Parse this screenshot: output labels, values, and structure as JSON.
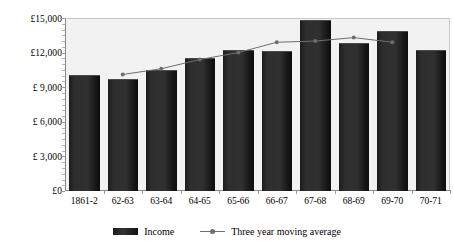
{
  "chart_data": {
    "type": "bar",
    "title": "",
    "xlabel": "",
    "ylabel": "",
    "categories": [
      "1861-2",
      "62-63",
      "63-64",
      "64-65",
      "65-66",
      "66-67",
      "67-68",
      "68-69",
      "69-70",
      "70-71"
    ],
    "ylim": [
      0,
      15000
    ],
    "ytick_values": [
      0,
      3000,
      6000,
      9000,
      12000,
      15000
    ],
    "ytick_labels": [
      "£0",
      "£ 3,000",
      "£ 6,000",
      "£ 9,000",
      "£12,000",
      "£15,000"
    ],
    "grid": false,
    "legend_position": "bottom",
    "series": [
      {
        "name": "Income",
        "type": "bar",
        "color": "#262626",
        "values": [
          10100,
          9700,
          10500,
          11500,
          12200,
          12100,
          14800,
          12800,
          13900,
          12200
        ]
      },
      {
        "name": "Three year moving average",
        "type": "line",
        "color": "#6e6e6e",
        "values": [
          null,
          10100,
          10600,
          11400,
          12000,
          12900,
          13000,
          13300,
          12900,
          null
        ]
      }
    ]
  },
  "legend": {
    "income_label": "Income",
    "moving_average_label": "Three year moving average"
  },
  "axis": {
    "y_labels": [
      "£15,000",
      "£12,000",
      "£ 9,000",
      "£ 6,000",
      "£ 3,000",
      "£0"
    ],
    "x_labels": [
      "1861-2",
      "62-63",
      "63-64",
      "64-65",
      "65-66",
      "66-67",
      "67-68",
      "68-69",
      "69-70",
      "70-71"
    ]
  },
  "colors": {
    "bar": "#262626",
    "line": "#6e6e6e",
    "plot_background": "#f2f2f2",
    "axis": "#8a8a8a",
    "page_background": "#ffffff"
  }
}
